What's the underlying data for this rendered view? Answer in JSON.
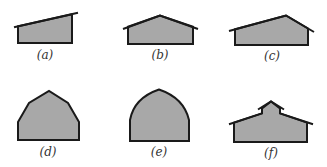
{
  "figure": {
    "panels": [
      {
        "id": "a",
        "label": "(a)",
        "roof_type": "shed"
      },
      {
        "id": "b",
        "label": "(b)",
        "roof_type": "gable"
      },
      {
        "id": "c",
        "label": "(c)",
        "roof_type": "asymmetric-gable"
      },
      {
        "id": "d",
        "label": "(d)",
        "roof_type": "gambrel"
      },
      {
        "id": "e",
        "label": "(e)",
        "roof_type": "gothic-arch"
      },
      {
        "id": "f",
        "label": "(f)",
        "roof_type": "monitor"
      }
    ],
    "colors": {
      "fill": "#a8a8a8",
      "stroke": "#1a1a1a",
      "label": "#333333"
    }
  }
}
